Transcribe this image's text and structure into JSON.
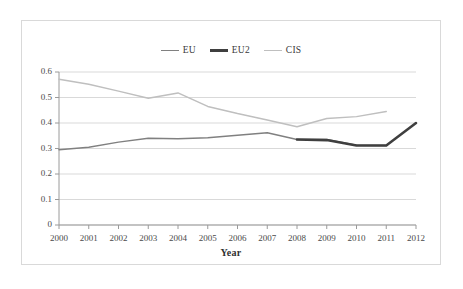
{
  "chart_data": {
    "type": "line",
    "title": "",
    "xlabel": "Year",
    "ylabel": "",
    "x": [
      2000,
      2001,
      2002,
      2003,
      2004,
      2005,
      2006,
      2007,
      2008,
      2009,
      2010,
      2011,
      2012
    ],
    "categories": [
      "2000",
      "2001",
      "2002",
      "2003",
      "2004",
      "2005",
      "2006",
      "2007",
      "2008",
      "2009",
      "2010",
      "2011",
      "2012"
    ],
    "series": [
      {
        "name": "EU",
        "color": "#808080",
        "values": [
          0.295,
          0.305,
          0.325,
          0.34,
          0.338,
          0.342,
          0.352,
          0.362,
          0.335,
          0.335,
          0.313,
          0.312,
          null
        ]
      },
      {
        "name": "EU2",
        "color": "#3f3f3f",
        "values": [
          null,
          null,
          null,
          null,
          null,
          null,
          null,
          null,
          0.335,
          0.333,
          0.312,
          0.312,
          0.4
        ]
      },
      {
        "name": "CIS",
        "color": "#bfbfbf",
        "values": [
          0.572,
          0.552,
          0.525,
          0.497,
          0.518,
          0.465,
          0.437,
          0.412,
          0.385,
          0.418,
          0.425,
          0.445,
          null
        ]
      }
    ],
    "ylim": [
      0,
      0.6
    ],
    "ytick_values": [
      0,
      0.1,
      0.2,
      0.3,
      0.4,
      0.5,
      0.6
    ],
    "ytick_labels": [
      "0",
      "0.1",
      "0.2",
      "0.3",
      "0.4",
      "0.5",
      "0.6"
    ],
    "grid": "horizontal",
    "legend_position": "top-center"
  },
  "legend": {
    "entries": [
      {
        "label": "EU",
        "color": "#808080",
        "thickness": 1.6
      },
      {
        "label": "EU2",
        "color": "#3f3f3f",
        "thickness": 3
      },
      {
        "label": "CIS",
        "color": "#bfbfbf",
        "thickness": 1.6
      }
    ]
  },
  "axes": {
    "x_title": "Year"
  }
}
